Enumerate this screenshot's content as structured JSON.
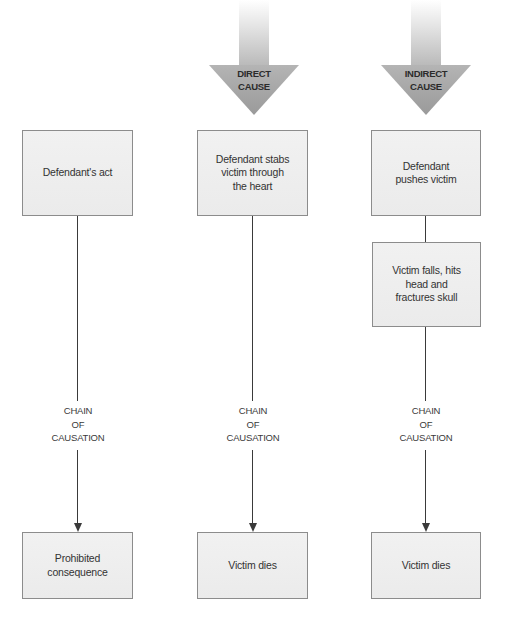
{
  "diagram": {
    "type": "causation-flowchart",
    "columns": [
      {
        "id": "general",
        "cause_arrow": null,
        "steps": [
          "Defendant's act"
        ],
        "chain_label": [
          "CHAIN",
          "OF",
          "CAUSATION"
        ],
        "outcome": "Prohibited consequence"
      },
      {
        "id": "direct",
        "cause_arrow": {
          "line1": "DIRECT",
          "line2": "CAUSE"
        },
        "steps": [
          "Defendant stabs victim through the heart"
        ],
        "chain_label": [
          "CHAIN",
          "OF",
          "CAUSATION"
        ],
        "outcome": "Victim dies"
      },
      {
        "id": "indirect",
        "cause_arrow": {
          "line1": "INDIRECT",
          "line2": "CAUSE"
        },
        "steps": [
          "Defendant pushes victim",
          "Victim falls, hits head and fractures skull"
        ],
        "chain_label": [
          "CHAIN",
          "OF",
          "CAUSATION"
        ],
        "outcome": "Victim dies"
      }
    ],
    "colors": {
      "box_fill": "#eeeeee",
      "box_border": "#8c8c8c",
      "line": "#3a3a3a",
      "arrow_head": "#a8a8a8",
      "text": "#333333"
    }
  }
}
